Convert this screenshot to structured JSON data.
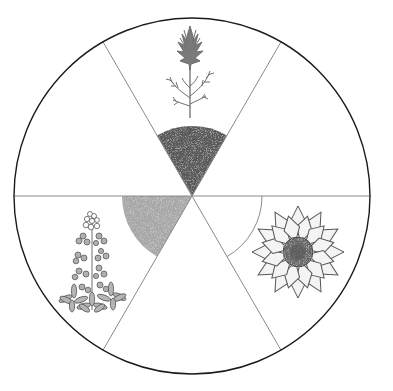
{
  "diagram": {
    "type": "circle-divided-into-sixths",
    "center": {
      "x": 192,
      "y": 196
    },
    "radius": 178,
    "sections": 6,
    "colors": {
      "outline": "#1a1a1a",
      "divider": "#8a8a8a",
      "dark_shade": "#5a5a5a",
      "light_shade": "#a8a8a8",
      "plant_gray": "#6e6e6e",
      "petal_fill": "#f4f4f4"
    },
    "shaded_regions": [
      {
        "name": "top-wedge-shaded",
        "shade": "dark",
        "start_deg": 240,
        "end_deg": 300,
        "radius": 70
      },
      {
        "name": "lower-left-wedge-shaded",
        "shade": "light",
        "start_deg": 120,
        "end_deg": 180,
        "radius": 70
      },
      {
        "name": "lower-right-wedge-outline",
        "shade": "none",
        "start_deg": 0,
        "end_deg": 60,
        "radius": 70
      }
    ],
    "illustrations": [
      {
        "name": "paintbrush-plant",
        "section": "top",
        "position": {
          "x": 190,
          "y": 68
        }
      },
      {
        "name": "bluebonnet-flower",
        "section": "lower-left",
        "position": {
          "x": 92,
          "y": 265
        }
      },
      {
        "name": "sunflower",
        "section": "lower-right",
        "position": {
          "x": 298,
          "y": 252
        }
      }
    ]
  }
}
